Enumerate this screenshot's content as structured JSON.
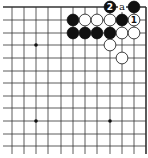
{
  "diagram": {
    "type": "go-board-corner",
    "view": "top-right corner (partial board, cut off at left and bottom)",
    "grid": {
      "columns_x": [
        12,
        24,
        36,
        48,
        61,
        73,
        85,
        97,
        110,
        122,
        134,
        146
      ],
      "rows_y": [
        7,
        20,
        33,
        45,
        58,
        71,
        83,
        96,
        108,
        121,
        134,
        146
      ],
      "left_extent": 3,
      "bottom_extent": 154,
      "edge_right": 146,
      "edge_top": 7
    },
    "star_points": [
      {
        "col": 2,
        "row": 3
      },
      {
        "col": 2,
        "row": 9
      },
      {
        "col": 8,
        "row": 9
      }
    ],
    "stones": [
      {
        "color": "black",
        "col": 8,
        "row": 0,
        "label": "2"
      },
      {
        "color": "black",
        "col": 10,
        "row": 0,
        "label": ""
      },
      {
        "color": "black",
        "col": 5,
        "row": 1,
        "label": ""
      },
      {
        "color": "white",
        "col": 6,
        "row": 1,
        "label": ""
      },
      {
        "color": "white",
        "col": 7,
        "row": 1,
        "label": ""
      },
      {
        "color": "white",
        "col": 8,
        "row": 1,
        "label": ""
      },
      {
        "color": "black",
        "col": 9,
        "row": 1,
        "label": ""
      },
      {
        "color": "white",
        "col": 10,
        "row": 1,
        "label": "1"
      },
      {
        "color": "black",
        "col": 5,
        "row": 2,
        "label": ""
      },
      {
        "color": "black",
        "col": 6,
        "row": 2,
        "label": ""
      },
      {
        "color": "black",
        "col": 7,
        "row": 2,
        "label": ""
      },
      {
        "color": "black",
        "col": 8,
        "row": 2,
        "label": ""
      },
      {
        "color": "white",
        "col": 9,
        "row": 2,
        "label": ""
      },
      {
        "color": "white",
        "col": 10,
        "row": 2,
        "label": ""
      },
      {
        "color": "white",
        "col": 8,
        "row": 3,
        "label": ""
      },
      {
        "color": "white",
        "col": 9,
        "row": 4,
        "label": ""
      }
    ],
    "point_labels": [
      {
        "col": 9,
        "row": 0,
        "text": "a"
      }
    ],
    "colors": {
      "line": "#333333",
      "black_stone": "#111111",
      "white_stone": "#ffffff",
      "background": "#ffffff"
    }
  }
}
